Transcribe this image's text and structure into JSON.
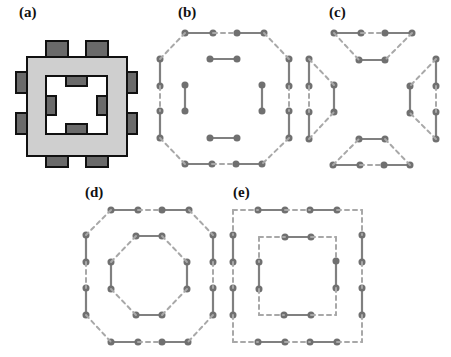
{
  "figure": {
    "panels": [
      {
        "id": "a",
        "label": "(a)",
        "description": "Square ring with tabs (tiles)"
      },
      {
        "id": "b",
        "label": "(b)",
        "description": "Octagonal outer loop with inner segments"
      },
      {
        "id": "c",
        "label": "(c)",
        "description": "Four trapezoid loops"
      },
      {
        "id": "d",
        "label": "(d)",
        "description": "Two concentric octagons"
      },
      {
        "id": "e",
        "label": "(e)",
        "description": "Two concentric squares"
      }
    ],
    "colors": {
      "ring_fill": "#cfcfcf",
      "tab_fill": "#6a6a6a",
      "outline": "#111111",
      "solid_edge": "#808080",
      "dashed_edge": "#a8a8a8"
    }
  }
}
